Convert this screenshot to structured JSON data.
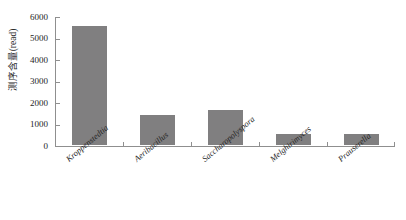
{
  "chart_data": {
    "type": "bar",
    "title": "",
    "xlabel": "",
    "ylabel": "测序含量(read)",
    "categories": [
      "Kroppenstedtia",
      "Aeribacillus",
      "Saccharopolyspora",
      "Melghirimyces",
      "Prauserella"
    ],
    "values": [
      5550,
      1400,
      1620,
      520,
      510
    ],
    "ylim": [
      0,
      6000
    ],
    "y_ticks": [
      0,
      1000,
      2000,
      3000,
      4000,
      5000,
      6000
    ],
    "y_tick_labels": [
      "0",
      "1000",
      "2000",
      "3000",
      "4000",
      "5000",
      "6000"
    ],
    "grid": false,
    "legend": false,
    "legend_position": "none",
    "bar_color": "#807f80",
    "axis_color": "#8f8f8f",
    "background_color": "#ffffff",
    "tick_direction": "in",
    "x_label_rotation": -40,
    "x_label_style": "italic"
  }
}
